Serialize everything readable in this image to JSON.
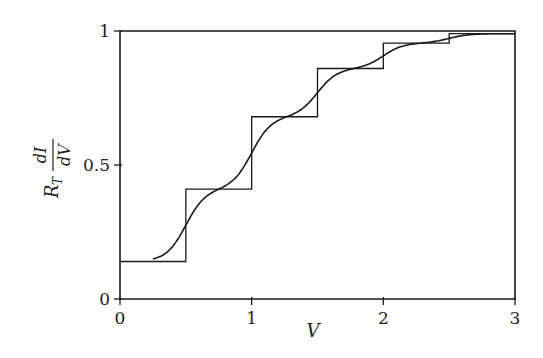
{
  "chart_data": {
    "type": "line",
    "title": "",
    "xlabel": "V",
    "ylabel": "R_T dI/dV",
    "ylabel_parts": {
      "prefix": "R",
      "subscript": "T",
      "numerator": "dI",
      "denominator": "dV"
    },
    "xlim": [
      0,
      3
    ],
    "ylim": [
      0,
      1
    ],
    "grid": false,
    "legend": null,
    "x_ticks": [
      0,
      1,
      2,
      3
    ],
    "x_tick_labels": [
      "0",
      "1",
      "2",
      "3"
    ],
    "y_ticks": [
      0,
      0.5,
      1
    ],
    "y_tick_labels": [
      "0",
      "0.5",
      "1"
    ],
    "series": [
      {
        "name": "step (T=0)",
        "style": "staircase",
        "x_edges": [
          0,
          0.5,
          1.0,
          1.5,
          2.0,
          2.5,
          3.0
        ],
        "levels": [
          0.14,
          0.41,
          0.68,
          0.86,
          0.955,
          0.99
        ]
      },
      {
        "name": "smoothed (finite T)",
        "style": "smooth",
        "x": [
          0.25,
          0.5,
          0.75,
          1.0,
          1.25,
          1.5,
          1.75,
          2.0,
          2.25,
          2.5,
          2.75,
          3.0
        ],
        "y": [
          0.14,
          0.27,
          0.41,
          0.55,
          0.68,
          0.77,
          0.86,
          0.91,
          0.955,
          0.975,
          0.99,
          1.0
        ]
      }
    ],
    "annotations": []
  },
  "plot": {
    "left": 120,
    "right": 515,
    "top": 31,
    "bottom": 299
  }
}
